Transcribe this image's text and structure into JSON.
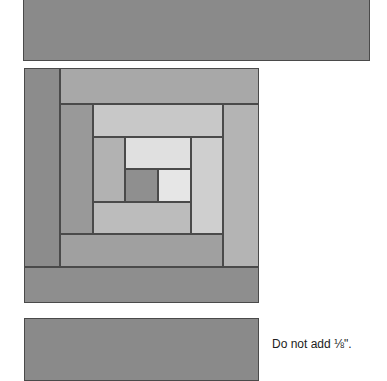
{
  "top_strip": {
    "x": 23,
    "y": -2,
    "w": 347,
    "h": 63,
    "color": "#8a8a8a"
  },
  "block": {
    "pieces": [
      {
        "name": "log-left-outer",
        "x": 24,
        "y": 68,
        "w": 36,
        "h": 199,
        "color": "#8c8c8c"
      },
      {
        "name": "log-top-outer",
        "x": 60,
        "y": 68,
        "w": 199,
        "h": 36,
        "color": "#a8a8a8"
      },
      {
        "name": "log-bottom-outer",
        "x": 24,
        "y": 267,
        "w": 235,
        "h": 36,
        "color": "#8e8e8e"
      },
      {
        "name": "log-right-second",
        "x": 223,
        "y": 104,
        "w": 36,
        "h": 163,
        "color": "#b4b4b4"
      },
      {
        "name": "log-left-second",
        "x": 60,
        "y": 104,
        "w": 33,
        "h": 130,
        "color": "#999999"
      },
      {
        "name": "log-bottom-second",
        "x": 60,
        "y": 234,
        "w": 163,
        "h": 33,
        "color": "#a0a0a0"
      },
      {
        "name": "log-top-third",
        "x": 93,
        "y": 104,
        "w": 130,
        "h": 33,
        "color": "#c8c8c8"
      },
      {
        "name": "log-right-third",
        "x": 191,
        "y": 137,
        "w": 32,
        "h": 97,
        "color": "#cfcfcf"
      },
      {
        "name": "log-left-third",
        "x": 93,
        "y": 137,
        "w": 32,
        "h": 65,
        "color": "#b2b2b2"
      },
      {
        "name": "log-bottom-third",
        "x": 93,
        "y": 202,
        "w": 98,
        "h": 32,
        "color": "#bcbcbc"
      },
      {
        "name": "log-top-inner",
        "x": 125,
        "y": 137,
        "w": 66,
        "h": 32,
        "color": "#e0e0e0"
      },
      {
        "name": "center-square",
        "x": 125,
        "y": 169,
        "w": 33,
        "h": 33,
        "color": "#8f8f8f"
      },
      {
        "name": "log-right-inner",
        "x": 158,
        "y": 169,
        "w": 33,
        "h": 33,
        "color": "#e6e6e6"
      }
    ]
  },
  "bottom_strip": {
    "x": 24,
    "y": 318,
    "w": 235,
    "h": 63,
    "color": "#8a8a8a"
  },
  "note": {
    "text": "Do not add ⅛\".",
    "x": 272,
    "y": 337
  }
}
